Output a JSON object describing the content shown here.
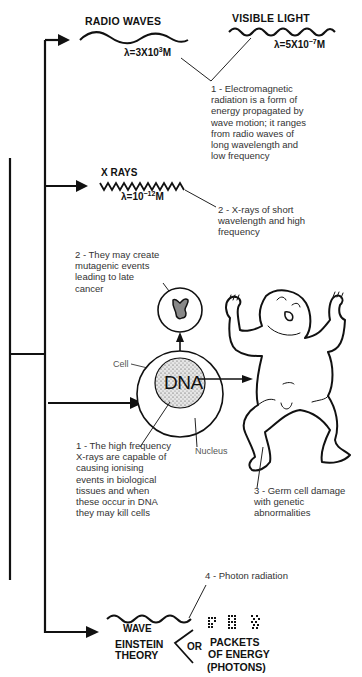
{
  "diagram": {
    "spectrum": {
      "radio": {
        "title": "RADIO WAVES",
        "wavelength_prefix": "λ=3X10",
        "wavelength_exp": "3",
        "wavelength_unit": "M"
      },
      "visible": {
        "title": "VISIBLE LIGHT",
        "wavelength_prefix": "λ=5X10",
        "wavelength_exp": "−7",
        "wavelength_unit": "M"
      },
      "xray": {
        "title": "X RAYS",
        "wavelength_prefix": "λ=10",
        "wavelength_exp": "−12",
        "wavelength_unit": "M"
      }
    },
    "notes": {
      "note1_em": "1 - Electromagnetic radiation is a form of energy propagated by wave motion; it ranges from radio waves of long wavelength and low frequency",
      "note2_xray": "2 - X-rays of short wavelength and high frequency",
      "note2_mutagenic": "2 - They may create mutagenic events leading to late cancer",
      "note1_ionising": "1 - The high frequency X-rays are capable of causing ionising events in biological tissues and when these occur in DNA they may kill cells",
      "note3_germ": "3 - Germ cell damage with genetic abnormalities",
      "note4_photon": "4 - Photon radiation"
    },
    "cell": {
      "cell_label": "Cell",
      "nucleus_label": "Nucleus",
      "dna_label": "DNA"
    },
    "theory": {
      "wave_label": "WAVE",
      "einstein_label": "EINSTEIN",
      "theory_label": "THEORY",
      "or_label": "OR",
      "packets_line1": "PACKETS",
      "packets_line2": "OF ENERGY",
      "packets_line3": "(PHOTONS)"
    },
    "colors": {
      "ink": "#111111",
      "note_text": "#333333",
      "background": "#ffffff",
      "dna_fill": "#d8d8d8"
    }
  }
}
